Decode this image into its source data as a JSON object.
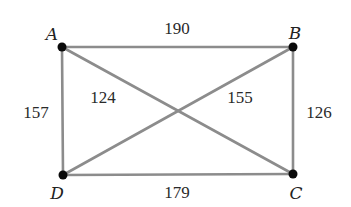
{
  "diagram": {
    "type": "weighted-complete-graph",
    "colors": {
      "edge": "#8c8c8c",
      "vertex": "#0a0a0a",
      "text": "#222222",
      "background": "#ffffff"
    },
    "vertices": [
      {
        "id": "A",
        "label": "A",
        "x": 62,
        "y": 47,
        "label_x": 52,
        "label_y": 40
      },
      {
        "id": "B",
        "label": "B",
        "x": 293,
        "y": 47,
        "label_x": 295,
        "label_y": 39
      },
      {
        "id": "C",
        "label": "C",
        "x": 293,
        "y": 174,
        "label_x": 296,
        "label_y": 199
      },
      {
        "id": "D",
        "label": "D",
        "x": 63,
        "y": 175,
        "label_x": 57,
        "label_y": 199
      }
    ],
    "edges": [
      {
        "id": "AB",
        "from": "A",
        "to": "B",
        "weight": "190",
        "label_x": 177,
        "label_y": 34
      },
      {
        "id": "DC",
        "from": "D",
        "to": "C",
        "weight": "179",
        "label_x": 177,
        "label_y": 198
      },
      {
        "id": "AD",
        "from": "A",
        "to": "D",
        "weight": "157",
        "label_x": 36,
        "label_y": 118
      },
      {
        "id": "BC",
        "from": "B",
        "to": "C",
        "weight": "126",
        "label_x": 319,
        "label_y": 118
      },
      {
        "id": "AC",
        "from": "A",
        "to": "C",
        "weight": "124",
        "label_x": 103,
        "label_y": 103
      },
      {
        "id": "BD",
        "from": "B",
        "to": "D",
        "weight": "155",
        "label_x": 240,
        "label_y": 103
      }
    ]
  }
}
